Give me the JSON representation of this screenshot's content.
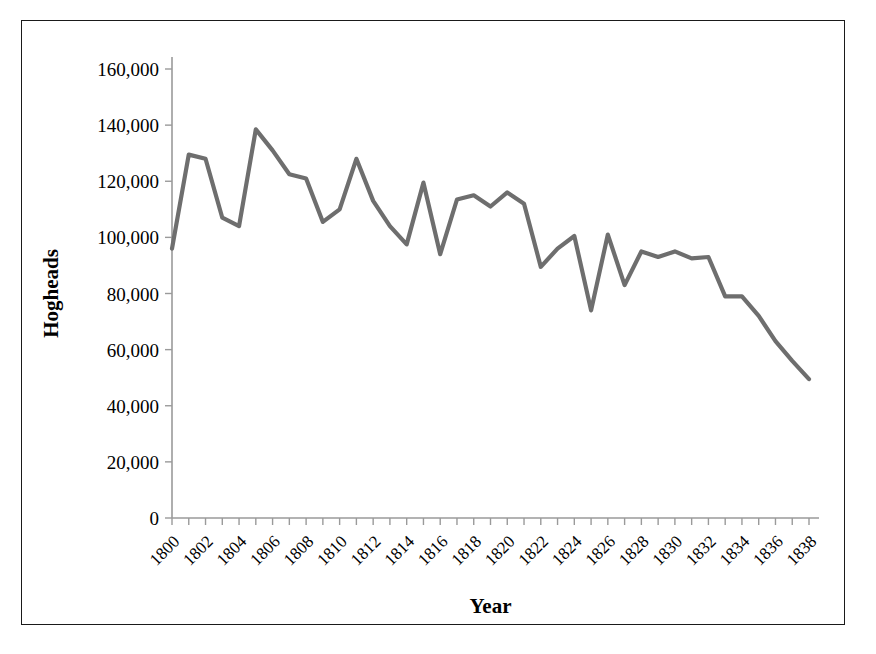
{
  "figure": {
    "border_color": "#1a1a1a",
    "background": "#ffffff"
  },
  "chart_data": {
    "type": "line",
    "title": "",
    "xlabel": "Year",
    "ylabel": "Hogheads",
    "xlim": [
      1800,
      1838
    ],
    "ylim": [
      0,
      160000
    ],
    "ytick_step": 20000,
    "xtick_step_labeled": 2,
    "xtick_step_minor": 1,
    "grid": false,
    "legend": false,
    "line_color": "#6e6e6e",
    "axis_color": "#9a9a9a",
    "ytick_labels": [
      "0",
      "20,000",
      "40,000",
      "60,000",
      "80,000",
      "100,000",
      "120,000",
      "140,000",
      "160,000"
    ],
    "ytick_values": [
      0,
      20000,
      40000,
      60000,
      80000,
      100000,
      120000,
      140000,
      160000
    ],
    "xtick_labels": [
      "1800",
      "1802",
      "1804",
      "1806",
      "1808",
      "1810",
      "1812",
      "1814",
      "1816",
      "1818",
      "1820",
      "1822",
      "1824",
      "1826",
      "1828",
      "1830",
      "1832",
      "1834",
      "1836",
      "1838"
    ],
    "xtick_values": [
      1800,
      1802,
      1804,
      1806,
      1808,
      1810,
      1812,
      1814,
      1816,
      1818,
      1820,
      1822,
      1824,
      1826,
      1828,
      1830,
      1832,
      1834,
      1836,
      1838
    ],
    "x": [
      1800,
      1801,
      1802,
      1803,
      1804,
      1805,
      1806,
      1807,
      1808,
      1809,
      1810,
      1811,
      1812,
      1813,
      1814,
      1815,
      1816,
      1817,
      1818,
      1819,
      1820,
      1821,
      1822,
      1823,
      1824,
      1825,
      1826,
      1827,
      1828,
      1829,
      1830,
      1831,
      1832,
      1833,
      1834,
      1835,
      1836,
      1837,
      1838
    ],
    "values": [
      96000,
      129500,
      128000,
      107000,
      104000,
      138500,
      131000,
      122500,
      121000,
      105500,
      110000,
      128000,
      113000,
      104000,
      97500,
      119500,
      94000,
      113500,
      115000,
      111000,
      116000,
      112000,
      89500,
      96000,
      100500,
      74000,
      101000,
      83000,
      95000,
      93000,
      95000,
      92500,
      93000,
      79000,
      79000,
      72000,
      63000,
      56000,
      49500
    ]
  }
}
